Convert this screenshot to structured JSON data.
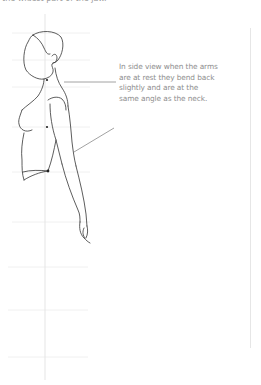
{
  "page": {
    "top_caption": "the widest part of the jaw.",
    "annotation": "In side view when the arms are at rest they bend back slightly and are at the same angle as the neck."
  },
  "figure": {
    "pose": "arms at rest, side profile",
    "colors": {
      "line": "#333333",
      "guide": "#e4e4e4",
      "pointer": "#8a8a8a",
      "text": "#8e8e8e"
    },
    "guides": {
      "vertical_center_x": 45,
      "horizontal_y": [
        33,
        60,
        87,
        114,
        141,
        168,
        195,
        222,
        249,
        276,
        304,
        357
      ]
    },
    "landmarks": [
      {
        "name": "neck-dot",
        "x": 47,
        "y": 80
      },
      {
        "name": "chest-dot",
        "x": 47,
        "y": 127
      },
      {
        "name": "waist-dot",
        "x": 48,
        "y": 171
      }
    ]
  }
}
